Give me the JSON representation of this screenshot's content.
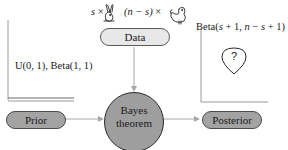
{
  "diagram": {
    "data_formula": {
      "left_var": "s",
      "times1": "×",
      "left_icon": "rabbit-icon",
      "right_var": "(n − s)",
      "times2": "×",
      "right_icon": "hen-icon"
    },
    "nodes": {
      "data": "Data",
      "prior": "Prior",
      "bayes_line1": "Bayes",
      "bayes_line2": "theorem",
      "posterior": "Posterior"
    },
    "prior_distribution_label": "U(0, 1), Beta(1, 1)",
    "posterior_distribution_label": {
      "prefix": "Beta(",
      "arg1": "s",
      "plus1": " + 1, ",
      "arg2": "n",
      "minus": " − ",
      "arg3": "s",
      "suffix": " + 1)"
    },
    "posterior_marker": "?",
    "colors": {
      "node_fill": "#a3a3a3",
      "data_fill": "#e8e8e8",
      "circle_fill": "#9e9e9e",
      "arrow": "#a8a8a8",
      "axis": "#9a9a9a"
    }
  }
}
